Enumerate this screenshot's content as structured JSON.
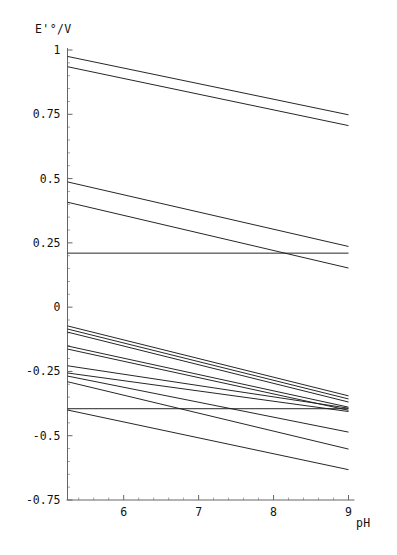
{
  "chart_data": {
    "type": "line",
    "title": "",
    "subtitle": "",
    "xlabel": "pH",
    "ylabel": "E'°/V",
    "xlim": [
      5.25,
      9.0
    ],
    "ylim": [
      -0.75,
      1.0
    ],
    "xticks": [
      6,
      7,
      8,
      9
    ],
    "xtick_labels": [
      "6",
      "7",
      "8",
      "9"
    ],
    "yticks": [
      1,
      0.75,
      0.5,
      0.25,
      0,
      -0.25,
      -0.5,
      -0.75
    ],
    "ytick_labels": [
      "1",
      "0.75",
      "0.5",
      "0.25",
      "0",
      "-0.25",
      "-0.5",
      "-0.75"
    ],
    "minor_ticks": true,
    "grid": false,
    "legend": null,
    "legend_position": "none",
    "line_color": "#1a1a1a",
    "axis_color": "#666666",
    "background": "#ffffff",
    "x": [
      5.25,
      9.0
    ],
    "series": [
      {
        "name": "line-01",
        "values": [
          0.975,
          0.748
        ],
        "slope": -0.0605
      },
      {
        "name": "line-02",
        "values": [
          0.935,
          0.706
        ],
        "slope": -0.0611
      },
      {
        "name": "line-03",
        "values": [
          0.487,
          0.236
        ],
        "slope": -0.0669
      },
      {
        "name": "line-04",
        "values": [
          0.408,
          0.152
        ],
        "slope": -0.0683
      },
      {
        "name": "line-05",
        "values": [
          0.21,
          0.21
        ],
        "slope": 0.0
      },
      {
        "name": "line-06",
        "values": [
          -0.073,
          -0.345
        ],
        "slope": -0.0725
      },
      {
        "name": "line-07",
        "values": [
          -0.085,
          -0.357
        ],
        "slope": -0.0725
      },
      {
        "name": "line-08",
        "values": [
          -0.097,
          -0.369
        ],
        "slope": -0.0725
      },
      {
        "name": "line-09",
        "values": [
          -0.151,
          -0.389
        ],
        "slope": -0.0635
      },
      {
        "name": "line-10",
        "values": [
          -0.163,
          -0.401
        ],
        "slope": -0.0635
      },
      {
        "name": "line-11",
        "values": [
          -0.228,
          -0.393
        ],
        "slope": -0.044
      },
      {
        "name": "line-12",
        "values": [
          -0.256,
          -0.406
        ],
        "slope": -0.04
      },
      {
        "name": "line-13",
        "values": [
          -0.268,
          -0.486
        ],
        "slope": -0.0581
      },
      {
        "name": "line-14",
        "values": [
          -0.29,
          -0.552
        ],
        "slope": -0.0699
      },
      {
        "name": "line-15",
        "values": [
          -0.395,
          -0.395
        ],
        "slope": 0.0
      },
      {
        "name": "line-16",
        "values": [
          -0.4,
          -0.632
        ],
        "slope": -0.0619
      }
    ]
  },
  "axes": {
    "y_axis_label": "E'°/V",
    "x_axis_label": "pH"
  }
}
